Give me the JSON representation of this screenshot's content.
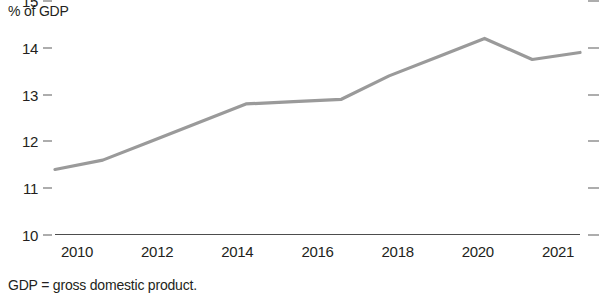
{
  "chart_data": {
    "type": "line",
    "title": "",
    "subtitle": "",
    "xlabel": "",
    "ylabel": "% of GDP",
    "x": [
      2010,
      2011,
      2012,
      2013,
      2014,
      2015,
      2016,
      2017,
      2018,
      2019,
      2020,
      2021
    ],
    "values": [
      11.4,
      11.6,
      12.0,
      12.4,
      12.8,
      12.85,
      12.9,
      13.4,
      13.8,
      14.2,
      13.75,
      13.9
    ],
    "series": [
      {
        "name": "% of GDP",
        "values": [
          11.4,
          11.6,
          12.0,
          12.4,
          12.8,
          12.85,
          12.9,
          13.4,
          13.8,
          14.2,
          13.75,
          13.9
        ]
      }
    ],
    "xlim": [
      2010,
      2021
    ],
    "ylim": [
      10,
      15
    ],
    "ytick_labels": [
      "15",
      "14",
      "13",
      "12",
      "11",
      "10"
    ],
    "ytick_values": [
      15,
      14,
      13,
      12,
      11,
      10
    ],
    "xtick_labels": [
      "2010",
      "2012",
      "2014",
      "2016",
      "2018",
      "2020",
      "2021"
    ],
    "xtick_values": [
      2010,
      2012,
      2014,
      2016,
      2018,
      2020,
      2021
    ],
    "grid": false,
    "legend": null,
    "legend_position": "none",
    "line_color": "#9a9a9a",
    "axis_color": "#4d4d4d",
    "text_color": "#231f20",
    "background_color": "#ffffff",
    "annotations": []
  },
  "footnote": {
    "text": "GDP = gross domestic product."
  }
}
